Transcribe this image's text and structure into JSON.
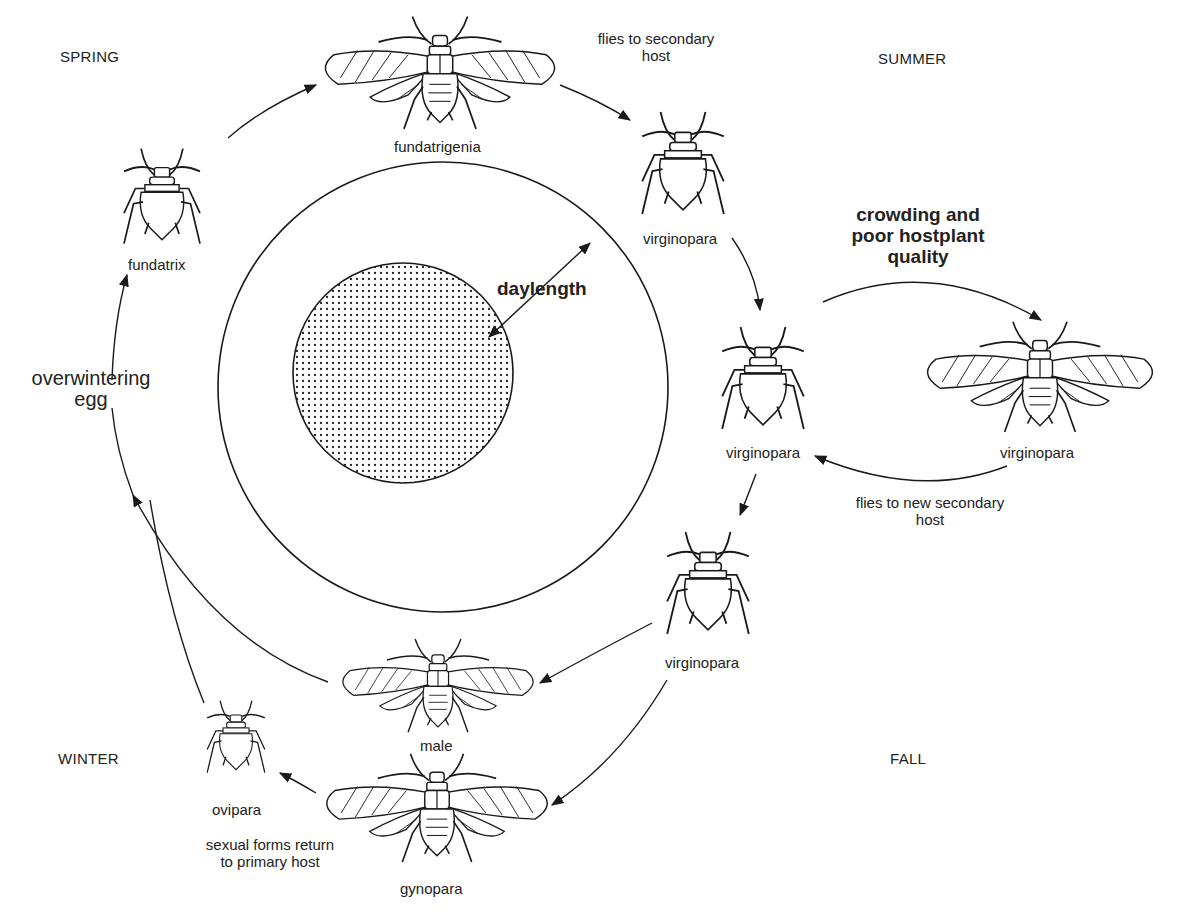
{
  "diagram": {
    "seasons": {
      "spring": "SPRING",
      "summer": "SUMMER",
      "fall": "FALL",
      "winter": "WINTER"
    },
    "center": {
      "label": "daylength"
    },
    "morphs": {
      "fundatrix": "fundatrix",
      "fundatrigenia": "fundatrigenia",
      "virginopara_1": "virginopara",
      "virginopara_2": "virginopara",
      "virginopara_winged": "virginopara",
      "virginopara_3": "virginopara",
      "male": "male",
      "gynopara": "gynopara",
      "ovipara": "ovipara"
    },
    "annotations": {
      "flies_to_secondary": "flies to secondary\nhost",
      "crowding": "crowding and\npoor hostplant\nquality",
      "flies_to_new_secondary": "flies to new secondary\nhost",
      "sexual_forms_return": "sexual forms return\nto primary host",
      "overwintering_egg": "overwintering\negg"
    },
    "colors": {
      "ink": "#1a1a1a",
      "background": "#ffffff"
    }
  }
}
